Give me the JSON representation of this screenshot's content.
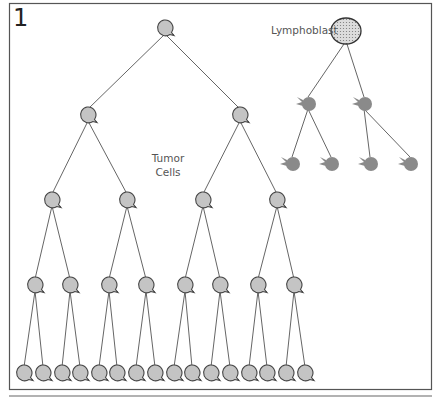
{
  "figure": {
    "panel_number": "1",
    "labels": {
      "tumor": [
        "Tumor",
        "Cells"
      ],
      "lymphoblast": "Lymphoblast"
    },
    "colors": {
      "frame": "#444444",
      "line": "#666666",
      "tumor_fill": "#c4c4c4",
      "tumor_stroke": "#444444",
      "lymph_fill": "#8a8a8a",
      "lymphoblast_fill": "#dcdcdc"
    },
    "tumor_tree": {
      "levels": [
        {
          "y": 28,
          "x": [
            165
          ]
        },
        {
          "y": 115,
          "x": [
            88,
            240
          ]
        },
        {
          "y": 200,
          "x": [
            52,
            127,
            203,
            277
          ]
        },
        {
          "y": 285,
          "x": [
            35,
            70,
            109,
            146,
            185,
            220,
            258,
            294
          ]
        },
        {
          "y": 373,
          "x": [
            24,
            43,
            62,
            80,
            99,
            117,
            136,
            155,
            174,
            192,
            211,
            230,
            249,
            267,
            286,
            305
          ]
        }
      ]
    },
    "lymph_tree": {
      "root": {
        "x": 346,
        "y": 31
      },
      "levels": [
        {
          "y": 103,
          "x": [
            308,
            364
          ]
        },
        {
          "y": 163,
          "x": [
            292,
            331,
            370,
            410
          ]
        }
      ]
    }
  }
}
